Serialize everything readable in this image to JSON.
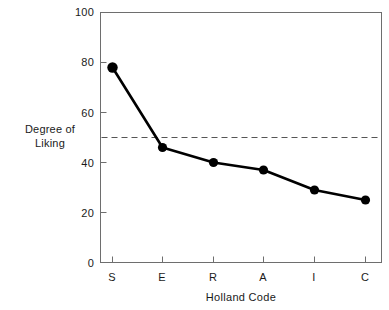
{
  "chart_data": {
    "type": "line",
    "title": "",
    "subtitle": "",
    "xlabel": "Holland Code",
    "ylabel": "Degree of\nLiking",
    "ylabel_line1": "Degree of",
    "ylabel_line2": "Liking",
    "categories": [
      "S",
      "E",
      "R",
      "A",
      "I",
      "C"
    ],
    "values": [
      78,
      46,
      40,
      37,
      29,
      25
    ],
    "series": [
      {
        "name": "Degree of Liking",
        "values": [
          78,
          46,
          40,
          37,
          29,
          25
        ]
      }
    ],
    "ylim": [
      0,
      100
    ],
    "yticks": [
      0,
      20,
      40,
      60,
      80,
      100
    ],
    "ytick_labels": [
      "0",
      "20",
      "40",
      "60",
      "80",
      "100"
    ],
    "xtick_labels": [
      "S",
      "E",
      "R",
      "A",
      "I",
      "C"
    ],
    "grid": false,
    "legend": "none",
    "annotations": [
      {
        "type": "reference-line",
        "orientation": "horizontal",
        "value": 50,
        "style": "dashed",
        "label": ""
      }
    ],
    "marker": "filled-circle",
    "line_color": "#000000",
    "marker_color": "#000000",
    "reference_line_color": "#555555",
    "frame_color": "#6e6e6e",
    "background_color": "#ffffff"
  }
}
